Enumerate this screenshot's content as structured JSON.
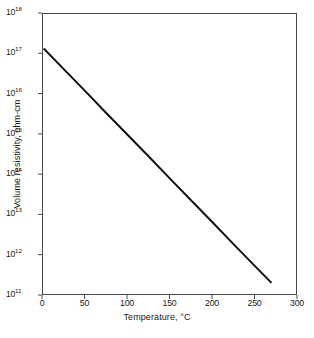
{
  "chart_data": {
    "type": "line",
    "title": "",
    "subtitle": "",
    "xlabel": "Temperature, °C",
    "ylabel": "Volume resistivity, ohm-cm",
    "xlim": [
      0,
      300
    ],
    "ylim_log10": [
      11,
      18
    ],
    "yscale": "log",
    "xscale": "linear",
    "grid": false,
    "legend": null,
    "xticks": [
      0,
      50,
      100,
      150,
      200,
      250,
      300
    ],
    "xtick_labels": [
      "0",
      "50",
      "100",
      "150",
      "200",
      "250",
      "300"
    ],
    "ytick_exponents": [
      11,
      12,
      13,
      14,
      15,
      16,
      17,
      18
    ],
    "ytick_labels": [
      {
        "mantissa": "10",
        "exponent": "11"
      },
      {
        "mantissa": "10",
        "exponent": "12"
      },
      {
        "mantissa": "10",
        "exponent": "13"
      },
      {
        "mantissa": "10",
        "exponent": "14"
      },
      {
        "mantissa": "10",
        "exponent": "15"
      },
      {
        "mantissa": "10",
        "exponent": "16"
      },
      {
        "mantissa": "10",
        "exponent": "17"
      },
      {
        "mantissa": "10",
        "exponent": "18"
      }
    ],
    "series": [
      {
        "name": "Volume resistivity",
        "color": "#111111",
        "linewidth": 2,
        "x": [
          2,
          25,
          50,
          75,
          100,
          125,
          150,
          175,
          200,
          225,
          250,
          270
        ],
        "y_log10": [
          17.12,
          16.62,
          16.08,
          15.53,
          14.99,
          14.45,
          13.9,
          13.36,
          12.82,
          12.27,
          11.73,
          11.3
        ],
        "y": [
          1.3e+17,
          4.2e+16,
          1.2e+16,
          3400000000000000.0,
          980000000000000.0,
          280000000000000.0,
          79000000000000.0,
          23000000000000.0,
          6600000000000.0,
          1900000000000.0,
          540000000000.0,
          200000000000.0
        ],
        "endpoints": {
          "start": {
            "x": 2,
            "y_log10": 17.12
          },
          "end": {
            "x": 270,
            "y_log10": 11.3
          }
        },
        "slope_decades_per_degC": -0.0217
      }
    ]
  },
  "axes": {
    "x_axis_name": "temperature-axis",
    "y_axis_name": "resistivity-axis"
  }
}
